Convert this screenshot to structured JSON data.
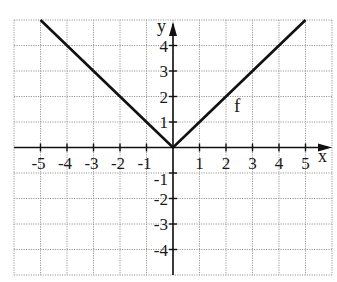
{
  "chart_data": {
    "type": "line",
    "title": "",
    "function": "f(x) = |x|",
    "series": [
      {
        "name": "f",
        "x": [
          -5,
          -4,
          -3,
          -2,
          -1,
          0,
          1,
          2,
          3,
          4,
          5
        ],
        "values": [
          5,
          4,
          3,
          2,
          1,
          0,
          1,
          2,
          3,
          4,
          5
        ]
      }
    ],
    "xlabel": "x",
    "ylabel": "y",
    "xlim": [
      -6.0,
      6.0
    ],
    "ylim": [
      -5.0,
      5.0
    ],
    "x_ticks": [
      -5,
      -4,
      -3,
      -2,
      -1,
      1,
      2,
      3,
      4,
      5
    ],
    "y_ticks": [
      -4,
      -3,
      -2,
      -1,
      1,
      2,
      3,
      4
    ],
    "grid": true,
    "grid_style": "dotted",
    "annotations": [
      {
        "text": "f",
        "x": 2.3,
        "y": 1.4
      }
    ],
    "legend": null
  },
  "labels": {
    "x_axis": "x",
    "y_axis": "y",
    "function_name": "f",
    "x_ticks": [
      "-5",
      "-4",
      "-3",
      "-2",
      "-1",
      "1",
      "2",
      "3",
      "4",
      "5"
    ],
    "y_ticks_pos": [
      "4",
      "3",
      "2",
      "1"
    ],
    "y_ticks_neg": [
      "-1",
      "-2",
      "-3",
      "-4"
    ]
  },
  "colors": {
    "line": "#111111",
    "axis": "#111111",
    "grid": "#9a9a9a",
    "background": "#ffffff"
  }
}
